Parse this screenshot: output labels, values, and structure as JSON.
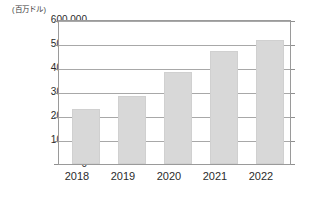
{
  "chart_data": {
    "type": "bar",
    "title": "",
    "subtitle": "",
    "unit_label": "(百万ドル)",
    "xlabel": "",
    "ylabel": "",
    "categories": [
      "2018",
      "2019",
      "2020",
      "2021",
      "2022"
    ],
    "values": [
      229000,
      283000,
      385000,
      470000,
      517000
    ],
    "series": [
      {
        "name": "金額",
        "values": [
          229000,
          283000,
          385000,
          470000,
          517000
        ]
      }
    ],
    "ylim": [
      0,
      600000
    ],
    "ytick_values": [
      600000,
      500000,
      400000,
      300000,
      200000,
      100000,
      0
    ],
    "ytick_labels": [
      "600,000",
      "500,000",
      "400,000",
      "300,000",
      "200,000",
      "100,000",
      "0"
    ],
    "grid": true,
    "grid_axis": "y",
    "legend": false,
    "legend_position": "none",
    "bar_color": "#d8d8d8",
    "grid_color": "#a8a8a8",
    "frame_color": "#9a9a9a",
    "text_color": "#2b2b2b",
    "background_color": "#ffffff"
  }
}
